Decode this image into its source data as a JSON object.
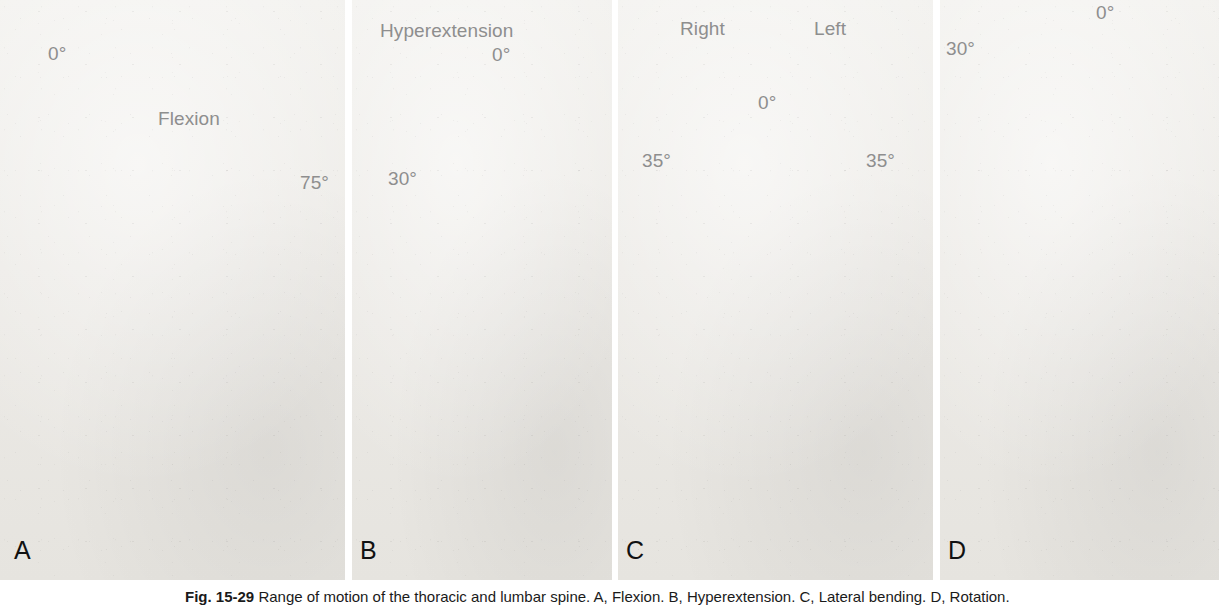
{
  "figure": {
    "caption_label": "Fig. 15-29",
    "caption_text": "Range of motion of the thoracic and lumbar spine. A, Flexion. B, Hyperextension. C, Lateral bending. D, Rotation."
  },
  "panels": [
    {
      "letter": "A",
      "name": "flexion",
      "labels": {
        "neutral": "0°",
        "motion": "Flexion",
        "range": "75°"
      }
    },
    {
      "letter": "B",
      "name": "hyperextension",
      "labels": {
        "motion": "Hyperextension",
        "neutral": "0°",
        "range": "30°"
      }
    },
    {
      "letter": "C",
      "name": "lateral-bending",
      "labels": {
        "right": "Right",
        "left": "Left",
        "neutral": "0°",
        "range_right": "35°",
        "range_left": "35°"
      }
    },
    {
      "letter": "D",
      "name": "rotation",
      "labels": {
        "neutral": "0°",
        "range": "30°"
      }
    }
  ],
  "colors": {
    "annotation_line": "#9a9a9a",
    "annotation_text": "#8e8e8e",
    "letter_text": "#111111",
    "leotard": "#141414",
    "skin": "#9a8f86",
    "backdrop": "#ebe9e5"
  }
}
